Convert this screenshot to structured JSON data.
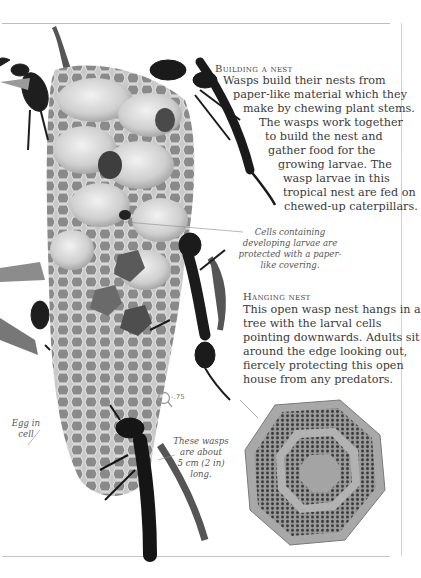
{
  "sections": [
    {
      "heading": "Building a nest",
      "lines": [
        "Wasps build their nests from",
        "paper-like material which they",
        "make by chewing plant stems.",
        "The wasps work together",
        "to build the nest and",
        "gather food for the",
        "growing larvae. The",
        "wasp larvae in this",
        "tropical nest are fed on",
        "chewed-up caterpillars."
      ]
    },
    {
      "heading": "Hanging nest",
      "lines": [
        "This open wasp nest hangs in a",
        "tree with the larval cells",
        "pointing downwards. Adults sit",
        "around the edge looking out,",
        "fiercely protecting this open",
        "house from any predators."
      ]
    }
  ],
  "captions": {
    "cells": [
      "Cells containing",
      "developing larvae are",
      "protected with a paper-",
      "like covering."
    ],
    "egg": [
      "Egg in",
      "cell"
    ],
    "size": [
      "These wasps",
      "are about",
      "5 cm (2 in)",
      "long."
    ]
  },
  "scale_marker": {
    "icon": "magnifier-icon",
    "label": "-.75"
  }
}
